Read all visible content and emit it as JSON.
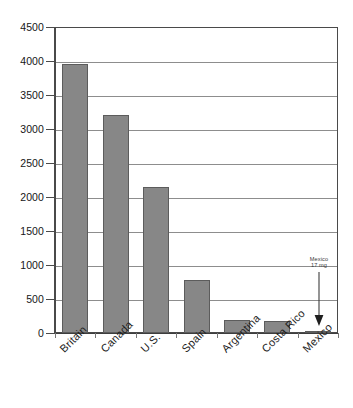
{
  "chart_data": {
    "type": "bar",
    "title": "",
    "subtitle": "",
    "xlabel": "",
    "ylabel": "",
    "categories": [
      "Britain",
      "Canada",
      "U.S.",
      "Spain",
      "Argentina",
      "Costa Rico",
      "Mexico"
    ],
    "values": [
      3950,
      3200,
      2150,
      780,
      190,
      175,
      17
    ],
    "ylim": [
      0,
      4500
    ],
    "y_ticks": [
      0,
      500,
      1000,
      1500,
      2000,
      2500,
      3000,
      3500,
      4000,
      4500
    ],
    "y_tick_labels": [
      "0",
      "500",
      "1000",
      "1500",
      "2000",
      "2500",
      "3000",
      "3500",
      "4000",
      "4500"
    ],
    "grid": true,
    "grid_axis": "y",
    "legend": false,
    "legend_position": "none",
    "series": [
      {
        "name": "",
        "values": [
          3950,
          3200,
          2150,
          780,
          190,
          175,
          17
        ],
        "color": "#878787"
      }
    ],
    "annotations": [
      {
        "name": "mexico-callout",
        "line1": "Mexico",
        "line2": "17 mg",
        "target_category": "Mexico",
        "target_value": 17,
        "arrow": "down"
      }
    ],
    "bar_color": "#878787",
    "bar_border_color": "#5c5c5c",
    "gridline_color": "#8d8d8d",
    "axis_color": "#4a4a4a",
    "background": "#ffffff"
  }
}
